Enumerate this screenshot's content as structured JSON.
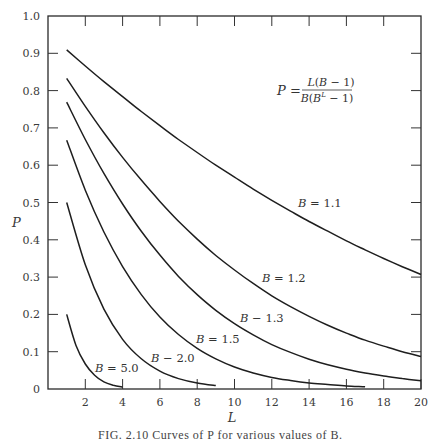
{
  "chart_data": {
    "type": "line",
    "title": "",
    "xlabel": "L",
    "ylabel": "P",
    "xlim": [
      0,
      20
    ],
    "ylim": [
      0,
      1.0
    ],
    "grid": false,
    "x_ticks": [
      2,
      4,
      6,
      8,
      10,
      12,
      14,
      16,
      18,
      20
    ],
    "y_ticks": [
      "0",
      "0.1",
      "0.2",
      "0.3",
      "0.4",
      "0.5",
      "0.6",
      "0.7",
      "0.8",
      "0.9",
      "1.0"
    ],
    "formula": {
      "lhs": "P =",
      "numerator": "L(B − 1)",
      "denominator_base": "B(B",
      "denominator_exp": "L",
      "denominator_tail": " − 1)"
    },
    "series": [
      {
        "name": "B = 1.1",
        "label_B": "B",
        "label_val": "= 1.1",
        "label_pos": [
          298,
          207
        ],
        "x": [
          1,
          2,
          3,
          4,
          5,
          6,
          7,
          8,
          9,
          10,
          11,
          12,
          13,
          14,
          15,
          16,
          17,
          18,
          19,
          20
        ],
        "values": [
          0.909,
          0.866,
          0.824,
          0.784,
          0.744,
          0.706,
          0.669,
          0.634,
          0.6,
          0.568,
          0.536,
          0.506,
          0.477,
          0.449,
          0.423,
          0.397,
          0.373,
          0.35,
          0.328,
          0.307
        ]
      },
      {
        "name": "B = 1.2",
        "label_B": "B",
        "label_val": "= 1.2",
        "label_pos": [
          262,
          282
        ],
        "x": [
          1,
          2,
          3,
          4,
          5,
          6,
          7,
          8,
          9,
          10,
          11,
          12,
          13,
          14,
          15,
          16,
          17,
          18,
          19,
          20
        ],
        "values": [
          0.833,
          0.758,
          0.687,
          0.621,
          0.56,
          0.503,
          0.45,
          0.402,
          0.358,
          0.319,
          0.283,
          0.25,
          0.221,
          0.195,
          0.171,
          0.15,
          0.131,
          0.115,
          0.1,
          0.087
        ]
      },
      {
        "name": "B = 1.3",
        "label_B": "B",
        "label_val": "− 1.3",
        "label_pos": [
          240,
          322
        ],
        "x": [
          1,
          2,
          3,
          4,
          5,
          6,
          7,
          8,
          9,
          10,
          11,
          12,
          13,
          14,
          15,
          16,
          17,
          18,
          19,
          20
        ],
        "values": [
          0.769,
          0.669,
          0.578,
          0.496,
          0.423,
          0.359,
          0.302,
          0.253,
          0.211,
          0.175,
          0.145,
          0.119,
          0.098,
          0.08,
          0.065,
          0.053,
          0.043,
          0.035,
          0.028,
          0.022
        ]
      },
      {
        "name": "B = 1.5",
        "label_B": "B",
        "label_val": "= 1.5",
        "label_pos": [
          196,
          343
        ],
        "x": [
          1,
          2,
          3,
          4,
          5,
          6,
          7,
          8,
          9,
          10,
          11,
          12,
          13,
          14,
          15,
          16,
          17
        ],
        "values": [
          0.667,
          0.533,
          0.421,
          0.328,
          0.253,
          0.193,
          0.146,
          0.109,
          0.081,
          0.059,
          0.043,
          0.031,
          0.023,
          0.016,
          0.012,
          0.008,
          0.006
        ]
      },
      {
        "name": "B = 2.0",
        "label_B": "B",
        "label_val": "− 2.0",
        "label_pos": [
          151,
          362
        ],
        "x": [
          1,
          2,
          3,
          4,
          5,
          6,
          7,
          8,
          9
        ],
        "values": [
          0.5,
          0.333,
          0.214,
          0.133,
          0.081,
          0.048,
          0.028,
          0.016,
          0.009
        ]
      },
      {
        "name": "B = 5.0",
        "label_B": "B",
        "label_val": "= 5.0",
        "label_pos": [
          95,
          372
        ],
        "x": [
          1,
          1.5,
          2,
          2.5,
          3,
          3.5,
          4
        ],
        "values": [
          0.2,
          0.117,
          0.067,
          0.037,
          0.019,
          0.01,
          0.005
        ]
      }
    ]
  },
  "caption": "FIG. 2.10   Curves of P for various values of B."
}
